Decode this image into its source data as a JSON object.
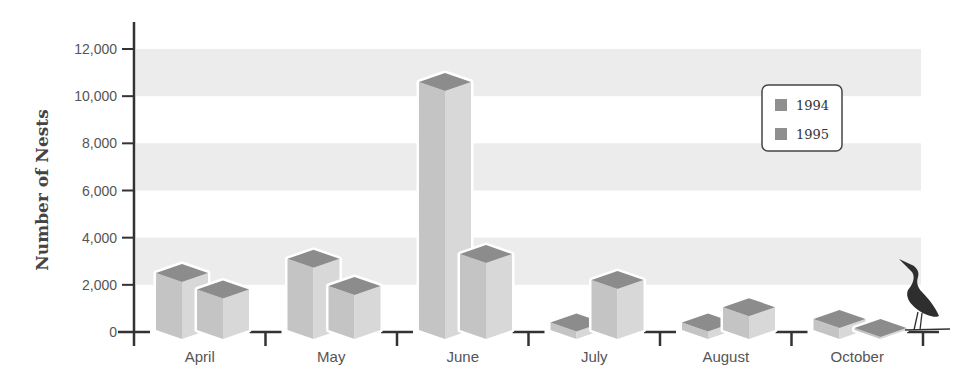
{
  "chart_data": {
    "type": "bar",
    "style": "3d-isometric-grouped",
    "title": "",
    "xlabel": "",
    "ylabel": "Number of Nests",
    "ylim": [
      0,
      12000
    ],
    "yticks": [
      0,
      2000,
      4000,
      6000,
      8000,
      10000,
      12000
    ],
    "ytick_labels": [
      "0",
      "2,000",
      "4,000",
      "6,000",
      "8,000",
      "10,000",
      "12,000"
    ],
    "categories": [
      "April",
      "May",
      "June",
      "July",
      "August",
      "October"
    ],
    "series": [
      {
        "name": "1994",
        "values": [
          2800,
          3400,
          10900,
          700,
          700,
          850
        ]
      },
      {
        "name": "1995",
        "values": [
          2100,
          2250,
          3600,
          2500,
          1350,
          100
        ]
      }
    ],
    "grid": "alternating horizontal bands (2,000–4,000; 6,000–8,000; 10,000–12,000)",
    "legend": {
      "position": "upper right",
      "entries": [
        "1994",
        "1995"
      ]
    },
    "decoration": "heron-silhouette-at-right-end-of-x-axis"
  },
  "colors": {
    "band": "#ececec",
    "axis": "#333333",
    "bar_front_left": "#c4c4c4",
    "bar_front_right": "#d8d8d8",
    "bar_top": "#8c8c8c",
    "bar_outline": "#ffffff",
    "legend_swatch": "#8f8f8f",
    "heron": "#2e2e2e"
  }
}
